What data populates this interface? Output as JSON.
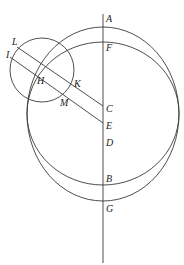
{
  "diagram": {
    "type": "geometry",
    "labels": {
      "A": "A",
      "F": "F",
      "L": "L",
      "I": "I",
      "H": "H",
      "K": "K",
      "M": "M",
      "C": "C",
      "E": "E",
      "D": "D",
      "B": "B",
      "G": "G"
    },
    "vertical_line": {
      "x": 103,
      "y1": 14,
      "y2": 263
    },
    "outer_circle": {
      "through": [
        "A",
        "G"
      ],
      "cx": 103,
      "cy": 114,
      "rx": 76,
      "ry": 87
    },
    "inner_circle": {
      "through": [
        "F",
        "B"
      ],
      "cx": 103,
      "cy": 113.5,
      "rx": 76,
      "ry": 71.5
    },
    "small_circle": {
      "cx": 42,
      "cy": 70,
      "r": 32
    },
    "segments": [
      {
        "from": "L",
        "to": "C",
        "x1": 17,
        "y1": 47,
        "x2": 103,
        "y2": 106
      },
      {
        "from": "I",
        "to": "E",
        "x1": 10,
        "y1": 57,
        "x2": 103,
        "y2": 123
      }
    ],
    "stroke_color": "#3a3a3a"
  }
}
